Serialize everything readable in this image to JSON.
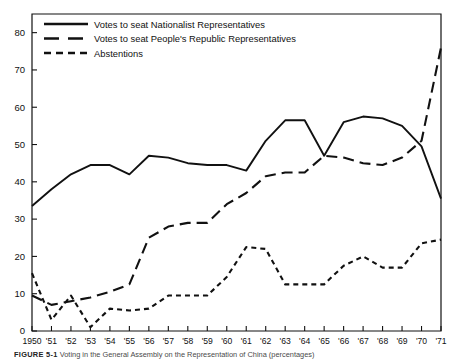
{
  "figure": {
    "caption_label": "FIGURE 5-1",
    "caption_text": "Voting in the General Assembly on the Representation of China (percentages)"
  },
  "legend": {
    "position": "top-left-inside",
    "items": [
      {
        "label": "Votes to seat Nationalist Representatives",
        "style": "solid",
        "name": "nationalist"
      },
      {
        "label": "Votes to seat People's Republic Representatives",
        "style": "long-dash",
        "name": "peoples-republic"
      },
      {
        "label": "Abstentions",
        "style": "short-dash",
        "name": "abstentions"
      }
    ]
  },
  "axes": {
    "y_ticks": [
      "0",
      "10",
      "20",
      "30",
      "40",
      "50",
      "60",
      "70",
      "80"
    ],
    "x_ticks": [
      "1950",
      "'51",
      "'52",
      "'53",
      "'54",
      "'55",
      "'56",
      "'57",
      "'58",
      "'59",
      "'60",
      "'61",
      "'62",
      "'63",
      "'64",
      "'65",
      "'66",
      "'67",
      "'68",
      "'69",
      "'70",
      "'71"
    ]
  },
  "chart_data": {
    "type": "line",
    "title": "Voting in the General Assembly on the Representation of China",
    "xlabel": "",
    "ylabel": "",
    "ylim": [
      0,
      85
    ],
    "xlim": [
      1950,
      1971
    ],
    "grid": false,
    "legend_position": "top-left",
    "categories": [
      1950,
      1951,
      1952,
      1953,
      1954,
      1955,
      1956,
      1957,
      1958,
      1959,
      1960,
      1961,
      1962,
      1963,
      1964,
      1965,
      1966,
      1967,
      1968,
      1969,
      1970,
      1971
    ],
    "series": [
      {
        "name": "Votes to seat Nationalist Representatives",
        "style": "solid",
        "color": "#111111",
        "values": [
          33.5,
          38.0,
          42.0,
          44.5,
          44.5,
          42.0,
          47.0,
          46.5,
          45.0,
          44.5,
          44.5,
          43.0,
          51.0,
          56.5,
          56.5,
          47.0,
          56.0,
          57.5,
          57.0,
          55.0,
          49.5,
          35.5
        ]
      },
      {
        "name": "Votes to seat People's Republic Representatives",
        "style": "long-dash",
        "color": "#111111",
        "values": [
          9.5,
          7.0,
          8.0,
          9.0,
          10.5,
          12.5,
          25.0,
          28.0,
          29.0,
          29.0,
          34.0,
          37.0,
          41.5,
          42.5,
          42.5,
          47.0,
          46.5,
          45.0,
          44.5,
          46.5,
          51.0,
          76.0
        ]
      },
      {
        "name": "Abstentions",
        "style": "short-dash",
        "color": "#111111",
        "values": [
          15.5,
          3.0,
          9.5,
          1.0,
          6.0,
          5.5,
          6.0,
          9.5,
          9.5,
          9.5,
          14.5,
          22.5,
          22.0,
          12.5,
          12.5,
          12.5,
          17.5,
          20.0,
          17.0,
          17.0,
          23.5,
          24.5
        ]
      }
    ]
  }
}
